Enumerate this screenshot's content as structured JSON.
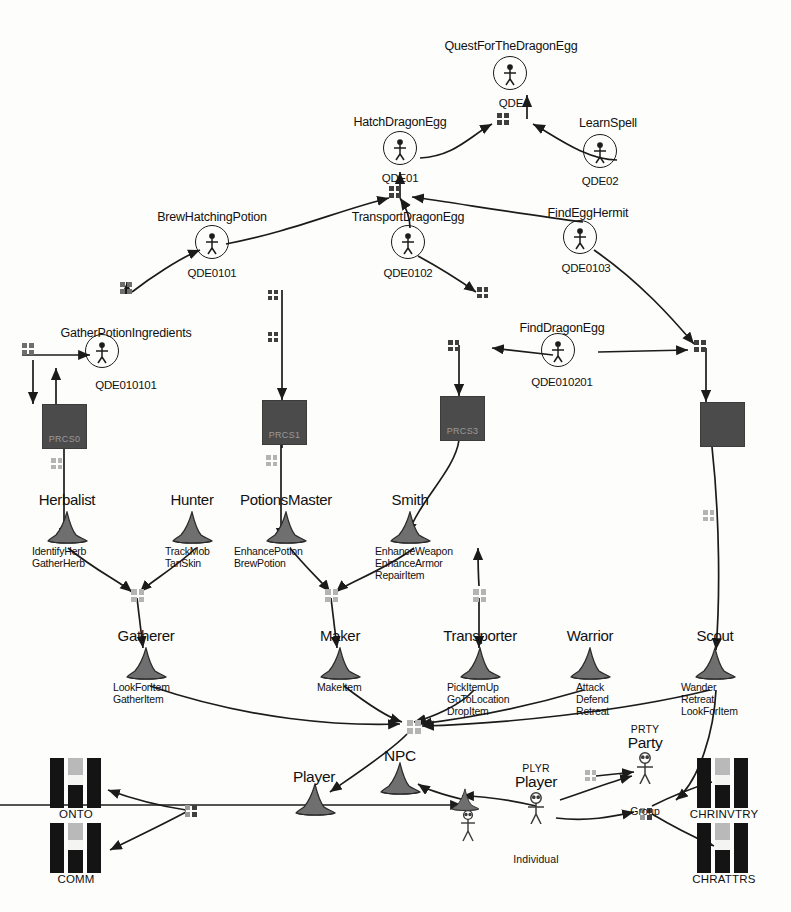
{
  "page": {
    "top_fragment": "3.2. Semantics of the",
    "ink_color": "#1b1b1b",
    "process_fill": "#4b4b4b",
    "connector_dark": "#3f3f3f",
    "connector_light": "#b4b4b4"
  },
  "quests": [
    {
      "title": "QuestForTheDragonEgg",
      "id": "QDE",
      "x": 510,
      "y": 73,
      "label_x": 511,
      "label_y": 40,
      "id_x": 511,
      "id_y": 97
    },
    {
      "title": "HatchDragonEgg",
      "id": "QDE01",
      "x": 400,
      "y": 148,
      "label_x": 400,
      "label_y": 116,
      "id_x": 400,
      "id_y": 172
    },
    {
      "title": "LearnSpell",
      "id": "QDE02",
      "x": 600,
      "y": 151,
      "label_x": 608,
      "label_y": 117,
      "id_x": 600,
      "id_y": 175
    },
    {
      "title": "BrewHatchingPotion",
      "id": "QDE0101",
      "x": 212,
      "y": 242,
      "label_x": 212,
      "label_y": 211,
      "id_x": 212,
      "id_y": 267
    },
    {
      "title": "TransportDragonEgg",
      "id": "QDE0102",
      "x": 408,
      "y": 242,
      "label_x": 408,
      "label_y": 211,
      "id_x": 408,
      "id_y": 267
    },
    {
      "title": "FindEggHermit",
      "id": "QDE0103",
      "x": 580,
      "y": 237,
      "label_x": 588,
      "label_y": 207,
      "id_x": 586,
      "id_y": 262
    },
    {
      "title": "GatherPotionIngredients",
      "id": "QDE010101",
      "x": 102,
      "y": 351,
      "label_x": 126,
      "label_y": 327,
      "id_x": 126,
      "id_y": 379
    },
    {
      "title": "FindDragonEgg",
      "id": "QDE010201",
      "x": 558,
      "y": 350,
      "label_x": 562,
      "label_y": 322,
      "id_x": 562,
      "id_y": 376
    }
  ],
  "processes": [
    {
      "label": "PRCS0",
      "x": 42,
      "y": 404,
      "w": 43,
      "h": 43
    },
    {
      "label": "PRCS1",
      "x": 262,
      "y": 400,
      "w": 43,
      "h": 43
    },
    {
      "label": "PRCS3",
      "x": 440,
      "y": 396,
      "w": 43,
      "h": 43
    },
    {
      "label": "",
      "x": 700,
      "y": 402,
      "w": 43,
      "h": 43
    }
  ],
  "roles": [
    {
      "name": "Herbalist",
      "x": 67,
      "y": 528,
      "label_x": 67,
      "label_y": 492,
      "actions": [
        "IdentifyHerb",
        "GatherHerb"
      ],
      "act_x": 32,
      "act_y": 546
    },
    {
      "name": "Hunter",
      "x": 192,
      "y": 528,
      "label_x": 192,
      "label_y": 492,
      "actions": [
        "TrackMob",
        "TanSkin"
      ],
      "act_x": 165,
      "act_y": 546
    },
    {
      "name": "PotionsMaster",
      "x": 286,
      "y": 528,
      "label_x": 286,
      "label_y": 492,
      "actions": [
        "EnhancePotion",
        "BrewPotion"
      ],
      "act_x": 234,
      "act_y": 546
    },
    {
      "name": "Smith",
      "x": 410,
      "y": 528,
      "label_x": 410,
      "label_y": 492,
      "actions": [
        "EnhanceWeapon",
        "EnhanceArmor",
        "RepairItem"
      ],
      "act_x": 375,
      "act_y": 546
    },
    {
      "name": "Gatherer",
      "x": 146,
      "y": 664,
      "label_x": 146,
      "label_y": 628,
      "actions": [
        "LookForItem",
        "GatherItem"
      ],
      "act_x": 113,
      "act_y": 682
    },
    {
      "name": "Maker",
      "x": 340,
      "y": 664,
      "label_x": 340,
      "label_y": 628,
      "actions": [
        "MakeItem"
      ],
      "act_x": 317,
      "act_y": 682
    },
    {
      "name": "Transporter",
      "x": 480,
      "y": 664,
      "label_x": 480,
      "label_y": 628,
      "actions": [
        "PickItemUp",
        "GoToLocation",
        "DropItem"
      ],
      "act_x": 447,
      "act_y": 682
    },
    {
      "name": "Warrior",
      "x": 590,
      "y": 664,
      "label_x": 590,
      "label_y": 628,
      "actions": [
        "Attack",
        "Defend",
        "Retreat"
      ],
      "act_x": 576,
      "act_y": 682
    },
    {
      "name": "Scout",
      "x": 715,
      "y": 664,
      "label_x": 715,
      "label_y": 628,
      "actions": [
        "Wander",
        "Retreat",
        "LookForItem"
      ],
      "act_x": 681,
      "act_y": 682
    }
  ],
  "actors": [
    {
      "name": "Player",
      "x": 315,
      "y": 800,
      "label_x": 314,
      "label_y": 769,
      "type": "hat"
    },
    {
      "name": "NPC",
      "x": 400,
      "y": 779,
      "label_x": 400,
      "label_y": 748,
      "type": "hat"
    },
    {
      "name": "Player",
      "x": 465,
      "y": 800,
      "label_x": null,
      "label_y": null,
      "type": "hat-small"
    }
  ],
  "persons": [
    {
      "tag": "PLYR",
      "name": "Player",
      "sub": "Individual",
      "x": 536,
      "y": 810,
      "tag_x": 536,
      "tag_y": 763,
      "name_x": 536,
      "name_y": 774,
      "sub_x": 536,
      "sub_y": 854
    },
    {
      "tag": "PRTY",
      "name": "Party",
      "sub": "Group",
      "x": 645,
      "y": 770,
      "tag_x": 645,
      "tag_y": 724,
      "name_x": 645,
      "name_y": 735,
      "sub_x": 645,
      "sub_y": 806
    }
  ],
  "entities": [
    {
      "name": "ONTO",
      "x": 50,
      "y": 758,
      "label_x": 76,
      "label_y": 808
    },
    {
      "name": "COMM",
      "x": 50,
      "y": 823,
      "label_x": 76,
      "label_y": 873
    },
    {
      "name": "CHRINVTRY",
      "x": 697,
      "y": 758,
      "label_x": 724,
      "label_y": 808
    },
    {
      "name": "CHRATTRS",
      "x": 697,
      "y": 823,
      "label_x": 724,
      "label_y": 873
    }
  ],
  "connectors": [
    {
      "x": 497,
      "y": 113,
      "size": 12,
      "tone": "dark"
    },
    {
      "x": 389,
      "y": 186,
      "size": 12,
      "tone": "dark"
    },
    {
      "x": 120,
      "y": 282,
      "size": 12,
      "tone": "mid"
    },
    {
      "x": 268,
      "y": 290,
      "size": 10,
      "tone": "dark"
    },
    {
      "x": 477,
      "y": 287,
      "size": 11,
      "tone": "dark"
    },
    {
      "x": 22,
      "y": 343,
      "size": 12,
      "tone": "mid"
    },
    {
      "x": 268,
      "y": 332,
      "size": 10,
      "tone": "dark"
    },
    {
      "x": 448,
      "y": 340,
      "size": 11,
      "tone": "dark"
    },
    {
      "x": 694,
      "y": 340,
      "size": 12,
      "tone": "dark"
    },
    {
      "x": 51,
      "y": 458,
      "size": 11,
      "tone": "light"
    },
    {
      "x": 266,
      "y": 455,
      "size": 11,
      "tone": "light"
    },
    {
      "x": 703,
      "y": 510,
      "size": 11,
      "tone": "light"
    },
    {
      "x": 131,
      "y": 589,
      "size": 13,
      "tone": "light"
    },
    {
      "x": 325,
      "y": 589,
      "size": 13,
      "tone": "light"
    },
    {
      "x": 473,
      "y": 589,
      "size": 13,
      "tone": "light"
    },
    {
      "x": 407,
      "y": 720,
      "size": 14,
      "tone": "light"
    },
    {
      "x": 185,
      "y": 805,
      "size": 12,
      "tone": "mix"
    },
    {
      "x": 585,
      "y": 770,
      "size": 11,
      "tone": "light"
    },
    {
      "x": 640,
      "y": 808,
      "size": 12,
      "tone": "mix"
    }
  ]
}
